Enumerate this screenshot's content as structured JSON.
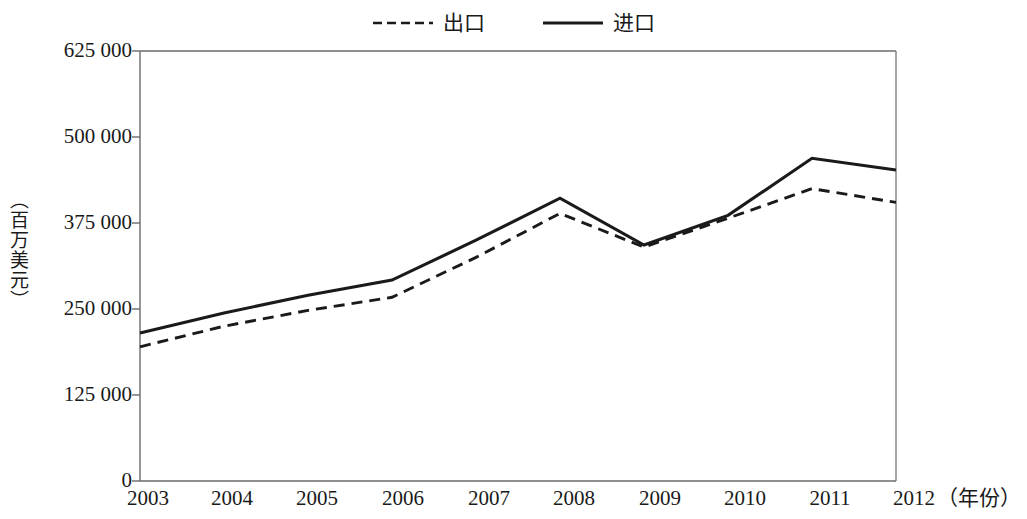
{
  "legend": {
    "position": "top-center",
    "items": [
      {
        "label": "出口",
        "style": "dashed",
        "color": "#1a1a1a",
        "name": "exports"
      },
      {
        "label": "进口",
        "style": "solid",
        "color": "#1a1a1a",
        "name": "imports"
      }
    ]
  },
  "axes": {
    "y_title": "（百万美元）",
    "x_unit": "（年份）",
    "y_ticks": [
      "0",
      "125 000",
      "250 000",
      "375 000",
      "500 000",
      "625 000"
    ],
    "x_ticks": [
      "2003",
      "2004",
      "2005",
      "2006",
      "2007",
      "2008",
      "2009",
      "2010",
      "2011",
      "2012"
    ]
  },
  "colors": {
    "line": "#1a1a1a",
    "axis": "#6b6b6b",
    "background": "#ffffff"
  },
  "chart_data": {
    "type": "line",
    "title": "",
    "subtitle": "",
    "xlabel": "（年份）",
    "ylabel": "（百万美元）",
    "categories": [
      "2003",
      "2004",
      "2005",
      "2006",
      "2007",
      "2008",
      "2009",
      "2010",
      "2011",
      "2012"
    ],
    "x": [
      2003,
      2004,
      2005,
      2006,
      2007,
      2008,
      2009,
      2010,
      2011,
      2012
    ],
    "series": [
      {
        "name": "出口",
        "style": "dashed",
        "color": "#1a1a1a",
        "values": [
          195000,
          225000,
          248000,
          267000,
          325000,
          389000,
          340000,
          382000,
          425000,
          405000
        ]
      },
      {
        "name": "进口",
        "style": "solid",
        "color": "#1a1a1a",
        "values": [
          215000,
          244000,
          270000,
          292000,
          350000,
          411000,
          343000,
          386000,
          469000,
          452000
        ]
      }
    ],
    "ylim": [
      0,
      625000
    ],
    "ytick_step": 125000,
    "xlim": [
      2003,
      2012
    ],
    "grid": false,
    "legend_position": "top-center"
  }
}
